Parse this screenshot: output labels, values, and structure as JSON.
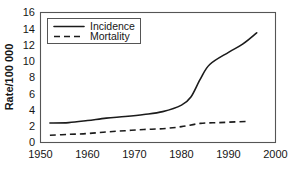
{
  "chart_data": {
    "type": "line",
    "title": "",
    "xlabel": "",
    "ylabel": "Rate/100 000",
    "xlim": [
      1950,
      2000
    ],
    "ylim": [
      0,
      16
    ],
    "xticks": [
      1950,
      1960,
      1970,
      1980,
      1990,
      2000
    ],
    "yticks": [
      0,
      2,
      4,
      6,
      8,
      10,
      12,
      14,
      16
    ],
    "grid": false,
    "legend_position": "top-left",
    "series": [
      {
        "name": "Incidence",
        "style": "solid",
        "x": [
          1952,
          1956,
          1960,
          1964,
          1968,
          1972,
          1976,
          1980,
          1982,
          1984,
          1986,
          1990,
          1993,
          1996
        ],
        "values": [
          2.4,
          2.45,
          2.7,
          3.0,
          3.2,
          3.45,
          3.8,
          4.6,
          5.6,
          7.8,
          9.6,
          11.1,
          12.1,
          13.5
        ]
      },
      {
        "name": "Mortality",
        "style": "dashed",
        "x": [
          1952,
          1956,
          1960,
          1964,
          1968,
          1972,
          1976,
          1980,
          1984,
          1988,
          1992,
          1994
        ],
        "values": [
          0.9,
          1.0,
          1.1,
          1.3,
          1.45,
          1.6,
          1.7,
          1.95,
          2.35,
          2.45,
          2.55,
          2.6
        ]
      }
    ]
  },
  "legend": {
    "entries": [
      {
        "label": "Incidence"
      },
      {
        "label": "Mortality"
      }
    ]
  },
  "colors": {
    "line": "#1b1b1b",
    "frame": "#555555",
    "text": "#161616",
    "background": "#ffffff"
  }
}
